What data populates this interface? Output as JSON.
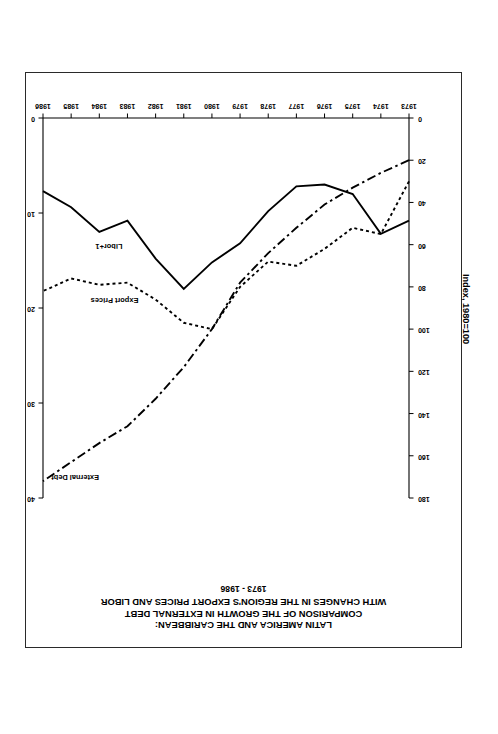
{
  "page": {
    "background": "#ffffff",
    "border_color": "#2a2a2a",
    "orientation": "rotated-180"
  },
  "chart_data": {
    "type": "line",
    "title": "LATIN AMERICA AND THE CARIBBEAN:",
    "title_line2": "COMPARISON OF THE GROWTH IN EXTERNAL DEBT",
    "title_line3": "WITH CHANGES IN THE REGION'S EXPORT PRICES AND LIBOR",
    "subtitle": "1973 - 1986",
    "xlabel": "",
    "ylabel": "Index, 1980=100",
    "y2label": "LIBOR +1 Percent",
    "ylim": [
      0,
      180
    ],
    "y2lim": [
      0,
      40
    ],
    "xlim": [
      1973,
      1986
    ],
    "grid": false,
    "legend": "inline-annotations",
    "x": [
      1973,
      1974,
      1975,
      1976,
      1977,
      1978,
      1979,
      1980,
      1981,
      1982,
      1983,
      1984,
      1985,
      1986
    ],
    "xticklabels": [
      "1973",
      "1974",
      "1975",
      "1976",
      "1977",
      "1978",
      "1979",
      "1980",
      "1981",
      "1982",
      "1983",
      "1984",
      "1985",
      "1986"
    ],
    "yticklabels": [
      "0",
      "20",
      "40",
      "60",
      "80",
      "100",
      "120",
      "140",
      "160",
      "180"
    ],
    "y2ticklabels": [
      "0",
      "10",
      "20",
      "30",
      "40"
    ],
    "series": [
      {
        "name": "External Debt",
        "axis": "left",
        "style": "dash-dot",
        "color": "#000000",
        "values": [
          20,
          26,
          33,
          41,
          52,
          64,
          78,
          100,
          118,
          133,
          146,
          154,
          163,
          172
        ]
      },
      {
        "name": "Export Prices",
        "axis": "left",
        "style": "dotted",
        "color": "#000000",
        "values": [
          30,
          55,
          52,
          62,
          70,
          68,
          80,
          100,
          97,
          86,
          78,
          79,
          76,
          82
        ]
      },
      {
        "name": "Libor+1",
        "axis": "right",
        "style": "solid",
        "color": "#000000",
        "values": [
          10.8,
          12.2,
          8.0,
          7.0,
          7.2,
          9.8,
          13.2,
          15.2,
          18.0,
          14.8,
          10.8,
          12.0,
          9.4,
          7.7
        ]
      }
    ],
    "annotations": [
      {
        "text": "External Debt",
        "series": "External Debt"
      },
      {
        "text": "Export Prices",
        "series": "Export Prices"
      },
      {
        "text": "Libor+1",
        "series": "Libor+1"
      }
    ]
  }
}
